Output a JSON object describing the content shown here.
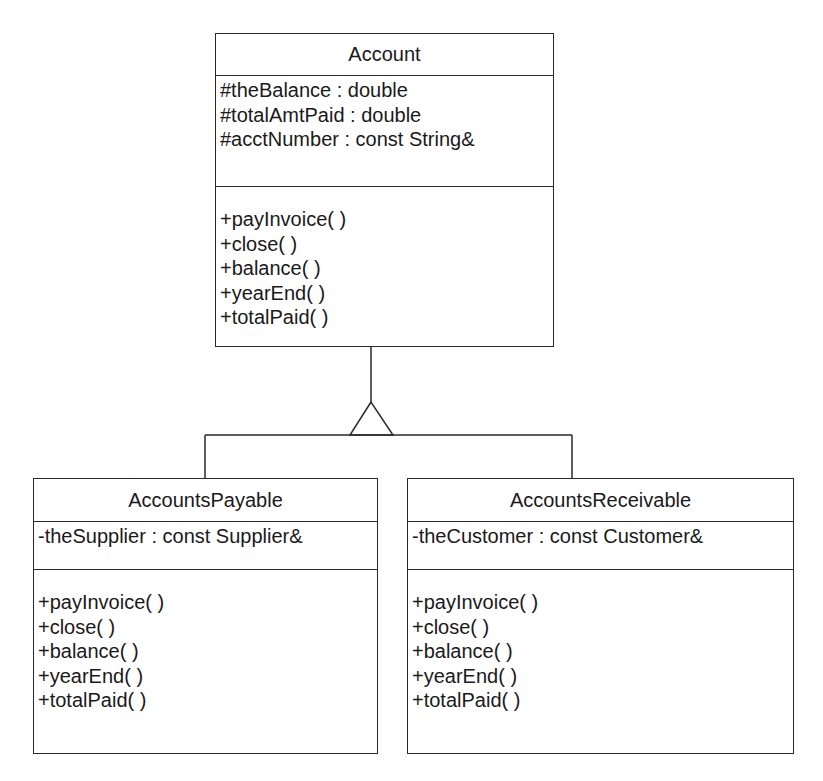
{
  "diagram": {
    "type": "UML class diagram",
    "relationship": "generalization",
    "colors": {
      "line": "#2a2a2a",
      "text": "#1a1a1a",
      "background": "#ffffff"
    }
  },
  "classes": {
    "account": {
      "name": "Account",
      "attributes": [
        "#theBalance : double",
        "#totalAmtPaid : double",
        "#acctNumber : const String&"
      ],
      "operations": [
        "+payInvoice( )",
        "+close( )",
        "+balance( )",
        "+yearEnd( )",
        "+totalPaid( )"
      ]
    },
    "payable": {
      "name": "AccountsPayable",
      "attributes": [
        "-theSupplier : const Supplier&"
      ],
      "operations": [
        "+payInvoice( )",
        "+close( )",
        "+balance( )",
        "+yearEnd( )",
        "+totalPaid( )"
      ]
    },
    "receivable": {
      "name": "AccountsReceivable",
      "attributes": [
        "-theCustomer : const Customer&"
      ],
      "operations": [
        "+payInvoice( )",
        "+close( )",
        "+balance( )",
        "+yearEnd( )",
        "+totalPaid( )"
      ]
    }
  },
  "edges": [
    {
      "from": "AccountsPayable",
      "to": "Account",
      "kind": "inheritance"
    },
    {
      "from": "AccountsReceivable",
      "to": "Account",
      "kind": "inheritance"
    }
  ]
}
